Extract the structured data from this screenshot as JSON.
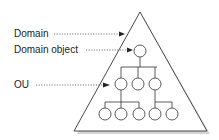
{
  "diagram": {
    "type": "domain-hierarchy",
    "labels": {
      "domain": "Domain",
      "domain_object": "Domain object",
      "ou": "OU"
    },
    "structure": {
      "container": "triangle (domain)",
      "root": "Domain object",
      "levels": [
        {
          "level": 1,
          "nodes": 1
        },
        {
          "level": 2,
          "nodes": 3
        },
        {
          "level": 3,
          "nodes": 5
        }
      ]
    },
    "colors": {
      "line": "#333333",
      "shadow": "#bbbbbb",
      "background": "#ffffff"
    }
  }
}
